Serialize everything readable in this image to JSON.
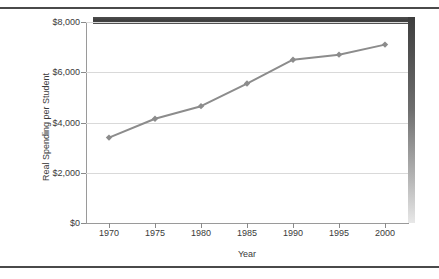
{
  "figure": {
    "has_top_rule": true,
    "has_bottom_rule": true,
    "background_color": "#ffffff",
    "frame_shadow_color": "#3d3d3d"
  },
  "chart_data": {
    "type": "line",
    "title": "",
    "xlabel": "Year",
    "ylabel": "Real Spending per Student",
    "categories": [
      1970,
      1975,
      1980,
      1985,
      1990,
      1995,
      2000
    ],
    "x_tick_labels": [
      "1970",
      "1975",
      "1980",
      "1985",
      "1990",
      "1995",
      "2000"
    ],
    "values": [
      3400,
      4150,
      4650,
      5550,
      6500,
      6700,
      7100
    ],
    "y_tick_values": [
      0,
      2000,
      4000,
      6000,
      8000
    ],
    "y_tick_labels": [
      "$0",
      "$2,000",
      "$4,000",
      "$6,000",
      "$8,000"
    ],
    "ylim": [
      0,
      8000
    ],
    "xlim": [
      1967.5,
      2002.5
    ],
    "grid": true,
    "grid_axis": "y",
    "grid_color": "#d9d9d9",
    "legend": false,
    "series_color": "#8c8c8c",
    "marker": "diamond",
    "marker_color": "#8c8c8c",
    "line_width": 2
  }
}
